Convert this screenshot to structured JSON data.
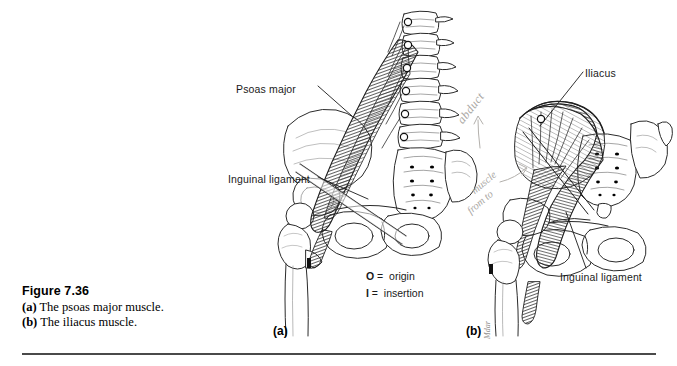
{
  "figure": {
    "number": "Figure 7.36",
    "caption_a_marker": "(a)",
    "caption_a_text": " The psoas major",
    "caption_b_marker": "(b)",
    "caption_mid_text": "muscle. ",
    "caption_b_text": " The iliacus",
    "caption_end_text": "muscle."
  },
  "panels": [
    {
      "letter": "(a)",
      "subject": "psoas major muscle"
    },
    {
      "letter": "(b)",
      "subject": "iliacus muscle"
    }
  ],
  "callouts": {
    "psoas_major": "Psoas major",
    "inguinal_ligament_a": "Inguinal ligament",
    "iliacus": "Iliacus",
    "inguinal_ligament_b": "Inguinal ligament"
  },
  "legend": {
    "rows": [
      {
        "key": "O",
        "equals": "=",
        "meaning": "origin"
      },
      {
        "key": "I",
        "equals": "=",
        "meaning": "insertion"
      }
    ]
  },
  "markers": {
    "origin": "O",
    "insertion": "I"
  },
  "annotations": {
    "pencil_abduct": "abduct",
    "pencil_note_1": "muscle",
    "pencil_note_2": "from to",
    "artist_signature": "Mdar"
  },
  "colors": {
    "background": "#ffffff",
    "ink": "#1a1a1a",
    "rule": "#4a4a4a",
    "muscle_shade": "#5f5f5f",
    "bone_outline": "#2b2b2b",
    "pencil": "#a9a6a2"
  }
}
